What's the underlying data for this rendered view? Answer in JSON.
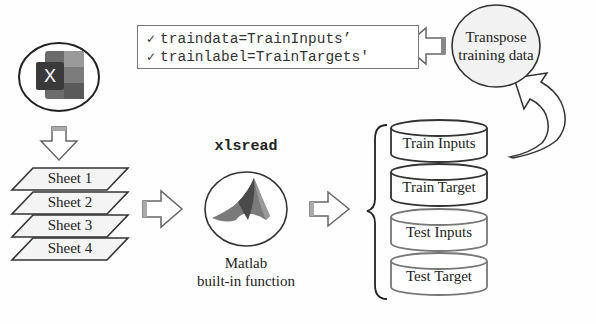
{
  "code_box": {
    "lines": [
      {
        "icon": "checkmark-icon",
        "check": "✓",
        "text": "traindata=TrainInputs’"
      },
      {
        "icon": "checkmark-icon",
        "check": "✓",
        "text": "trainlabel=TrainTargets'"
      }
    ]
  },
  "transpose": {
    "line1": "Transpose",
    "line2": "training data"
  },
  "excel": {
    "icon": "excel-icon",
    "letter": "X"
  },
  "sheets": [
    "Sheet 1",
    "Sheet 2",
    "Sheet 3",
    "Sheet 4"
  ],
  "function": {
    "name": "xlsread",
    "icon": "matlab-icon",
    "caption_line1": "Matlab",
    "caption_line2": "built-in function"
  },
  "datasets": [
    "Train Inputs",
    "Train Target",
    "Test Inputs",
    "Test Target"
  ],
  "colors": {
    "stroke": "#333333",
    "light_stroke": "#777777",
    "arrow_fill": "#ffffff",
    "ellipse_fill": "#f2f2f2",
    "excel_dark": "#2f2f2f",
    "excel_mid": "#555555",
    "excel_light": "#8a8a8a"
  }
}
